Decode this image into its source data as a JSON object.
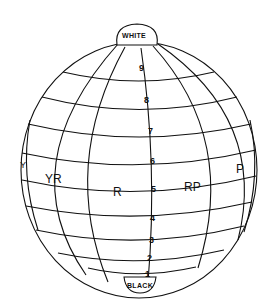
{
  "diagram": {
    "type": "munsell-color-sphere",
    "colors": {
      "line": "#111111",
      "background": "#ffffff"
    },
    "poles": {
      "top": {
        "label": "WHITE"
      },
      "bottom": {
        "label": "BLACK"
      }
    },
    "value_scale": {
      "labels": [
        "9",
        "8",
        "7",
        "6",
        "5",
        "4",
        "3",
        "2",
        "1"
      ]
    },
    "hue_labels": [
      "Y",
      "YR",
      "R",
      "RP",
      "P"
    ]
  }
}
